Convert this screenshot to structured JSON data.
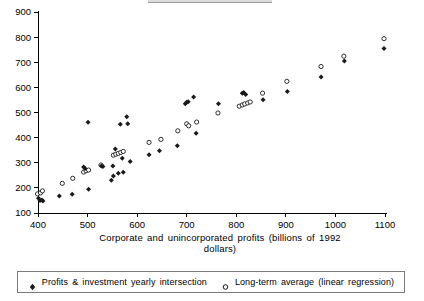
{
  "chart_data": {
    "type": "scatter",
    "title": "",
    "xlabel": "Corporate and unincorporated profits (billions of 1992 dollars)",
    "ylabel": "",
    "xlim": [
      400,
      1100
    ],
    "ylim": [
      100,
      900
    ],
    "xticks": [
      400,
      500,
      600,
      700,
      800,
      900,
      1000,
      1100
    ],
    "yticks": [
      100,
      200,
      300,
      400,
      500,
      600,
      700,
      800,
      900
    ],
    "grid": false,
    "legend_position": "bottom",
    "series": [
      {
        "name": "Profits & investment yearly intersection",
        "marker": "filled-diamond",
        "color": "#1a1a1a",
        "points": [
          [
            401,
            159
          ],
          [
            404,
            150
          ],
          [
            408,
            152
          ],
          [
            410,
            148
          ],
          [
            443,
            168
          ],
          [
            469,
            175
          ],
          [
            492,
            283
          ],
          [
            495,
            277
          ],
          [
            501,
            461
          ],
          [
            502,
            195
          ],
          [
            528,
            287
          ],
          [
            531,
            285
          ],
          [
            548,
            230
          ],
          [
            551,
            287
          ],
          [
            552,
            247
          ],
          [
            556,
            355
          ],
          [
            562,
            258
          ],
          [
            566,
            453
          ],
          [
            570,
            318
          ],
          [
            572,
            262
          ],
          [
            579,
            483
          ],
          [
            581,
            455
          ],
          [
            586,
            305
          ],
          [
            624,
            332
          ],
          [
            645,
            348
          ],
          [
            681,
            368
          ],
          [
            697,
            535
          ],
          [
            700,
            541
          ],
          [
            703,
            543
          ],
          [
            714,
            562
          ],
          [
            719,
            417
          ],
          [
            764,
            535
          ],
          [
            812,
            577
          ],
          [
            815,
            580
          ],
          [
            819,
            572
          ],
          [
            854,
            551
          ],
          [
            903,
            584
          ],
          [
            971,
            641
          ],
          [
            1018,
            705
          ],
          [
            1098,
            755
          ]
        ]
      },
      {
        "name": "Long-term average (linear regression)",
        "marker": "open-circle",
        "color": "#1a1a1a",
        "points": [
          [
            399,
            176
          ],
          [
            405,
            180
          ],
          [
            409,
            188
          ],
          [
            449,
            218
          ],
          [
            470,
            238
          ],
          [
            492,
            263
          ],
          [
            497,
            268
          ],
          [
            502,
            271
          ],
          [
            527,
            291
          ],
          [
            552,
            330
          ],
          [
            557,
            334
          ],
          [
            562,
            337
          ],
          [
            567,
            341
          ],
          [
            572,
            345
          ],
          [
            624,
            381
          ],
          [
            648,
            393
          ],
          [
            682,
            427
          ],
          [
            700,
            455
          ],
          [
            704,
            447
          ],
          [
            720,
            462
          ],
          [
            763,
            498
          ],
          [
            806,
            525
          ],
          [
            812,
            530
          ],
          [
            817,
            534
          ],
          [
            823,
            538
          ],
          [
            828,
            542
          ],
          [
            853,
            577
          ],
          [
            902,
            624
          ],
          [
            971,
            683
          ],
          [
            1017,
            724
          ],
          [
            1098,
            794
          ]
        ]
      }
    ]
  },
  "axis": {
    "x_title_line1": "Corporate and unincorporated profits (billions of 1992",
    "x_title_line2": "dollars)"
  },
  "legend": {
    "entries": [
      {
        "label": "Profits & investment yearly intersection",
        "marker": "filled-diamond"
      },
      {
        "label": "Long-term average (linear regression)",
        "marker": "open-circle"
      }
    ]
  }
}
